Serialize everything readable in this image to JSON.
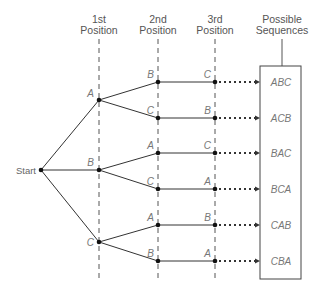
{
  "diagram": {
    "type": "tree-diagram",
    "headers": {
      "col1": [
        "1st",
        "Position"
      ],
      "col2": [
        "2nd",
        "Position"
      ],
      "col3": [
        "3rd",
        "Position"
      ],
      "col4": [
        "Possible",
        "Sequences"
      ]
    },
    "start_label": "Start",
    "level1": [
      "A",
      "B",
      "C"
    ],
    "level2": [
      "B",
      "C",
      "A",
      "C",
      "A",
      "B"
    ],
    "level3": [
      "C",
      "B",
      "C",
      "A",
      "B",
      "A"
    ],
    "sequences": [
      "ABC",
      "ACB",
      "BAC",
      "BCA",
      "CAB",
      "CBA"
    ],
    "colors": {
      "line": "#333333",
      "text": "#777777"
    }
  }
}
